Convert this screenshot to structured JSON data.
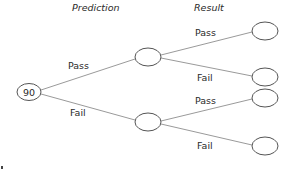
{
  "headers": {
    "prediction": "Prediction",
    "result": "Result"
  },
  "root": {
    "value": "90"
  },
  "branches": {
    "prediction_pass": "Pass",
    "prediction_fail": "Fail",
    "pass_result_pass": "Pass",
    "pass_result_fail": "Fail",
    "fail_result_pass": "Pass",
    "fail_result_fail": "Fail"
  },
  "colors": {
    "edge": "#9a9a9a",
    "node_stroke": "#555555",
    "text": "#2a2a2a"
  }
}
